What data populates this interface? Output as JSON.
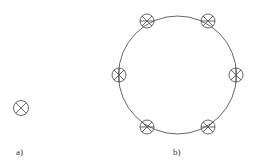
{
  "figure": {
    "panel_a": {
      "label": "a)",
      "symbol": "circle-x-icon"
    },
    "panel_b": {
      "label": "b)",
      "ring_symbol_count": 6,
      "symbol": "circle-spoke-icon"
    }
  },
  "colors": {
    "stroke": "#555555",
    "background": "#ffffff"
  }
}
